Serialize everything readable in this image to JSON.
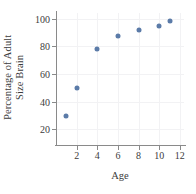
{
  "chart_data": {
    "type": "scatter",
    "title": "",
    "xlabel": "Age",
    "ylabel": "Percentage of Adult Size Brain",
    "ylabel_lines": [
      "Percentage of Adult",
      "Size Brain"
    ],
    "x": [
      1,
      2,
      4,
      6,
      8,
      10,
      11
    ],
    "values": [
      30,
      50,
      78,
      87.5,
      91.5,
      94.5,
      98
    ],
    "series": [
      {
        "name": "Percentage of Adult Size Brain",
        "points": [
          {
            "x": 1,
            "y": 30
          },
          {
            "x": 2,
            "y": 50
          },
          {
            "x": 4,
            "y": 78
          },
          {
            "x": 6,
            "y": 87.5
          },
          {
            "x": 8,
            "y": 91.5
          },
          {
            "x": 10,
            "y": 94.5
          },
          {
            "x": 11,
            "y": 98
          }
        ]
      }
    ],
    "xlim": [
      0,
      12.4
    ],
    "ylim": [
      8,
      104
    ],
    "xticks": [
      2,
      4,
      6,
      8,
      10,
      12
    ],
    "yticks": [
      20,
      40,
      60,
      80,
      100
    ],
    "xtick_labels": [
      "2",
      "4",
      "6",
      "8",
      "10",
      "12"
    ],
    "ytick_labels": [
      "20",
      "40",
      "60",
      "80",
      "100"
    ],
    "grid": true,
    "legend": "none",
    "marker_color": "#5b7ba8",
    "grid_color": "#f2f2f4",
    "axis_color": "#8a8a8a",
    "background_color": "#ffffff"
  }
}
